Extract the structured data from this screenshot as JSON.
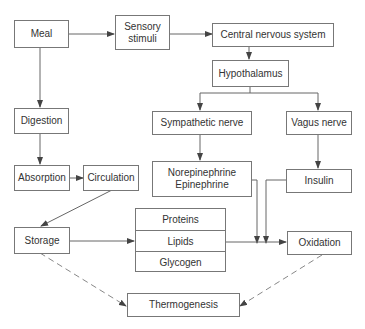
{
  "diagram": {
    "nodes": {
      "meal": "Meal",
      "sensory_line1": "Sensory",
      "sensory_line2": "stimuli",
      "cns": "Central nervous system",
      "hypothalamus": "Hypothalamus",
      "digestion": "Digestion",
      "sympathetic": "Sympathetic nerve",
      "vagus": "Vagus nerve",
      "absorption": "Absorption",
      "circulation": "Circulation",
      "norepinephrine": "Norepinephrine",
      "epinephrine": "Epinephrine",
      "insulin": "Insulin",
      "storage": "Storage",
      "proteins": "Proteins",
      "lipids": "Lipids",
      "glycogen": "Glycogen",
      "oxidation": "Oxidation",
      "thermogenesis": "Thermogenesis"
    },
    "edges": [
      {
        "from": "Meal",
        "to": "Sensory stimuli",
        "style": "solid"
      },
      {
        "from": "Sensory stimuli",
        "to": "Central nervous system",
        "style": "solid"
      },
      {
        "from": "Central nervous system",
        "to": "Hypothalamus",
        "style": "solid"
      },
      {
        "from": "Hypothalamus",
        "to": "Sympathetic nerve",
        "style": "solid"
      },
      {
        "from": "Hypothalamus",
        "to": "Vagus nerve",
        "style": "solid"
      },
      {
        "from": "Sympathetic nerve",
        "to": "Norepinephrine Epinephrine",
        "style": "solid"
      },
      {
        "from": "Vagus nerve",
        "to": "Insulin",
        "style": "solid"
      },
      {
        "from": "Meal",
        "to": "Digestion",
        "style": "solid"
      },
      {
        "from": "Digestion",
        "to": "Absorption",
        "style": "solid"
      },
      {
        "from": "Absorption",
        "to": "Circulation",
        "style": "solid"
      },
      {
        "from": "Circulation",
        "to": "Storage",
        "style": "solid"
      },
      {
        "from": "Storage",
        "to": "Proteins/Lipids/Glycogen",
        "style": "solid"
      },
      {
        "from": "Proteins/Lipids/Glycogen",
        "to": "Oxidation",
        "style": "solid"
      },
      {
        "from": "Norepinephrine Epinephrine",
        "to": "Oxidation pathway",
        "style": "solid"
      },
      {
        "from": "Insulin",
        "to": "Oxidation pathway",
        "style": "solid"
      },
      {
        "from": "Storage",
        "to": "Thermogenesis",
        "style": "dashed"
      },
      {
        "from": "Oxidation",
        "to": "Thermogenesis",
        "style": "dashed"
      }
    ]
  }
}
